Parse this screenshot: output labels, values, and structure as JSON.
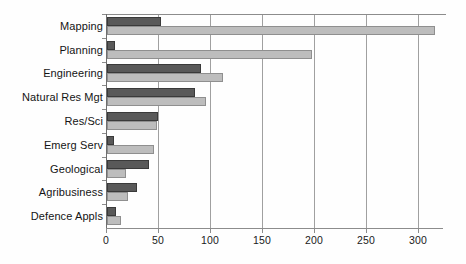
{
  "chart_data": {
    "type": "bar",
    "orientation": "horizontal",
    "title": "",
    "subtitle": "",
    "xlabel": "",
    "ylabel": "",
    "categories": [
      "Mapping",
      "Planning",
      "Engineering",
      "Natural Res Mgt",
      "Res/Sci",
      "Emerg Serv",
      "Geological",
      "Agribusiness",
      "Defence Appls"
    ],
    "series": [
      {
        "name": "Series 1",
        "color": "#595959",
        "values": [
          52,
          8,
          90,
          85,
          49,
          7,
          40,
          29,
          9
        ]
      },
      {
        "name": "Series 2",
        "color": "#bdbdbd",
        "values": [
          315,
          197,
          112,
          95,
          48,
          45,
          18,
          20,
          13
        ]
      }
    ],
    "xlim": [
      0,
      325
    ],
    "xticks": [
      0,
      50,
      100,
      150,
      200,
      250,
      300
    ],
    "xtick_labels": [
      "0",
      "50",
      "100",
      "150",
      "200",
      "250",
      "300"
    ],
    "grid": "vertical",
    "legend": "none",
    "axis_color": "#8c8c8c",
    "text_color": "#141414",
    "background": "#ffffff"
  }
}
